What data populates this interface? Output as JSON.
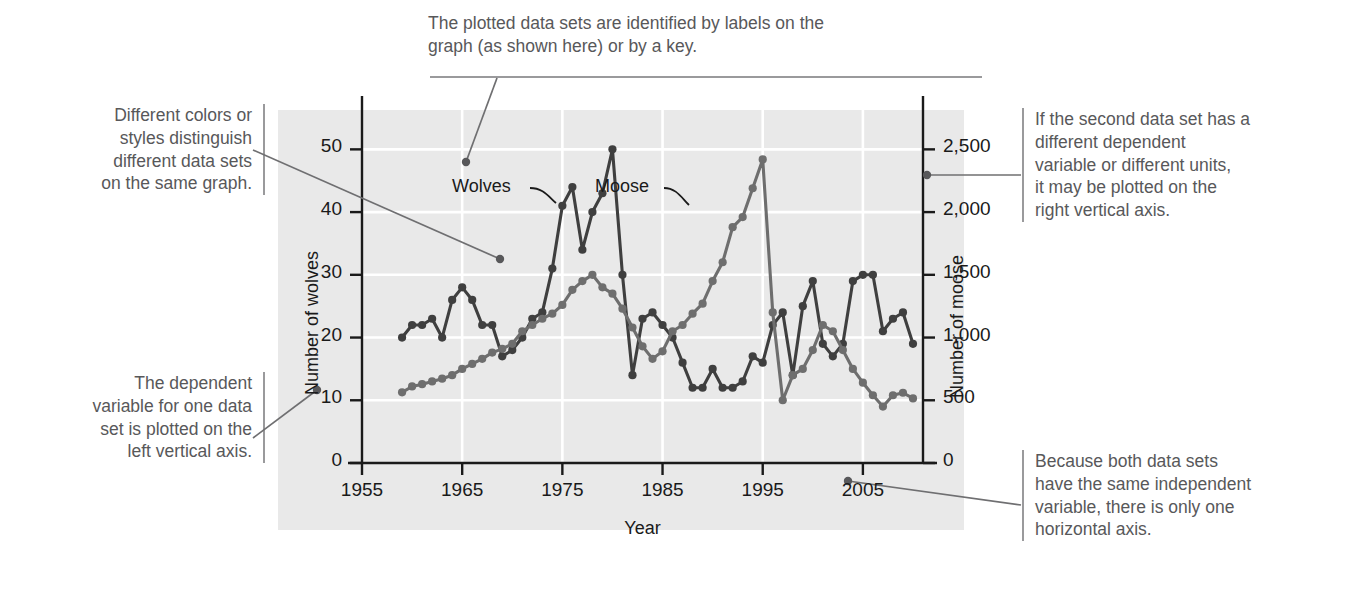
{
  "figure": {
    "title_none": "",
    "annotations": {
      "top": "The plotted data sets are identified by labels on the\ngraph (as shown here) or by a key.",
      "left_top": "Different colors or\nstyles distinguish\ndifferent data sets\non the same graph.",
      "left_bottom": "The dependent\nvariable for one data\nset is plotted on the\nleft vertical axis.",
      "right_top": "If the second data set has a\ndifferent dependent\nvariable or different units,\nit may be plotted on the\nright vertical axis.",
      "right_bottom": "Because both data sets\nhave the same independent\nvariable, there is only one\nhorizontal axis."
    }
  },
  "colors": {
    "panel_background": "#e9e9e9",
    "gridline": "#ffffff",
    "axis": "#1a1a1a",
    "annotation_text": "#58585a",
    "rule": "#9a9a9c",
    "wolves_series": "#3f3f3f",
    "moose_series": "#6e6e6e",
    "leader_line": "#6f6f71"
  },
  "chart_data": {
    "type": "line",
    "title": "",
    "xlabel": "Year",
    "ylabel": "Number of wolves",
    "y2label": "Number of moose",
    "grid": true,
    "legend": "inline-labels",
    "xlim": [
      1955,
      2011
    ],
    "xticks": [
      "1955",
      "1965",
      "1975",
      "1985",
      "1995",
      "2005"
    ],
    "xtick_values": [
      1955,
      1965,
      1975,
      1985,
      1995,
      2005
    ],
    "ylim": [
      0,
      55
    ],
    "yticks": [
      "0",
      "10",
      "20",
      "30",
      "40",
      "50"
    ],
    "ytick_values": [
      0,
      10,
      20,
      30,
      40,
      50
    ],
    "y2lim": [
      0,
      2750
    ],
    "y2ticks": [
      "0",
      "500",
      "1,000",
      "1,500",
      "2,000",
      "2,500"
    ],
    "y2tick_values": [
      0,
      500,
      1000,
      1500,
      2000,
      2500
    ],
    "x": [
      1959,
      1960,
      1961,
      1962,
      1963,
      1964,
      1965,
      1966,
      1967,
      1968,
      1969,
      1970,
      1971,
      1972,
      1973,
      1974,
      1975,
      1976,
      1977,
      1978,
      1979,
      1980,
      1981,
      1982,
      1983,
      1984,
      1985,
      1986,
      1987,
      1988,
      1989,
      1990,
      1991,
      1992,
      1993,
      1994,
      1995,
      1996,
      1997,
      1998,
      1999,
      2000,
      2001,
      2002,
      2003,
      2004,
      2005,
      2006,
      2007,
      2008,
      2009,
      2010
    ],
    "series": [
      {
        "name": "Wolves",
        "axis": "left",
        "label_anchor_year": 1977,
        "values": [
          20,
          22,
          22,
          23,
          20,
          26,
          28,
          26,
          22,
          22,
          17,
          18,
          20,
          23,
          24,
          31,
          41,
          44,
          34,
          40,
          43,
          50,
          30,
          14,
          23,
          24,
          22,
          20,
          16,
          12,
          12,
          15,
          12,
          12,
          13,
          17,
          16,
          22,
          24,
          14,
          25,
          29,
          19,
          17,
          19,
          29,
          30,
          30,
          21,
          23,
          24,
          19
        ]
      },
      {
        "name": "Moose",
        "axis": "right",
        "label_anchor_year": 1993,
        "values": [
          563,
          610,
          628,
          650,
          672,
          700,
          750,
          790,
          830,
          880,
          910,
          950,
          1050,
          1100,
          1150,
          1190,
          1260,
          1380,
          1450,
          1500,
          1400,
          1350,
          1230,
          1080,
          930,
          830,
          890,
          1050,
          1100,
          1190,
          1270,
          1450,
          1600,
          1880,
          1960,
          2190,
          2420,
          1200,
          500,
          700,
          750,
          900,
          1100,
          1050,
          900,
          750,
          640,
          540,
          450,
          540,
          560,
          515
        ]
      }
    ],
    "inline_labels": [
      {
        "text": "Wolves",
        "series": "Wolves"
      },
      {
        "text": "Moose",
        "series": "Moose"
      }
    ]
  }
}
